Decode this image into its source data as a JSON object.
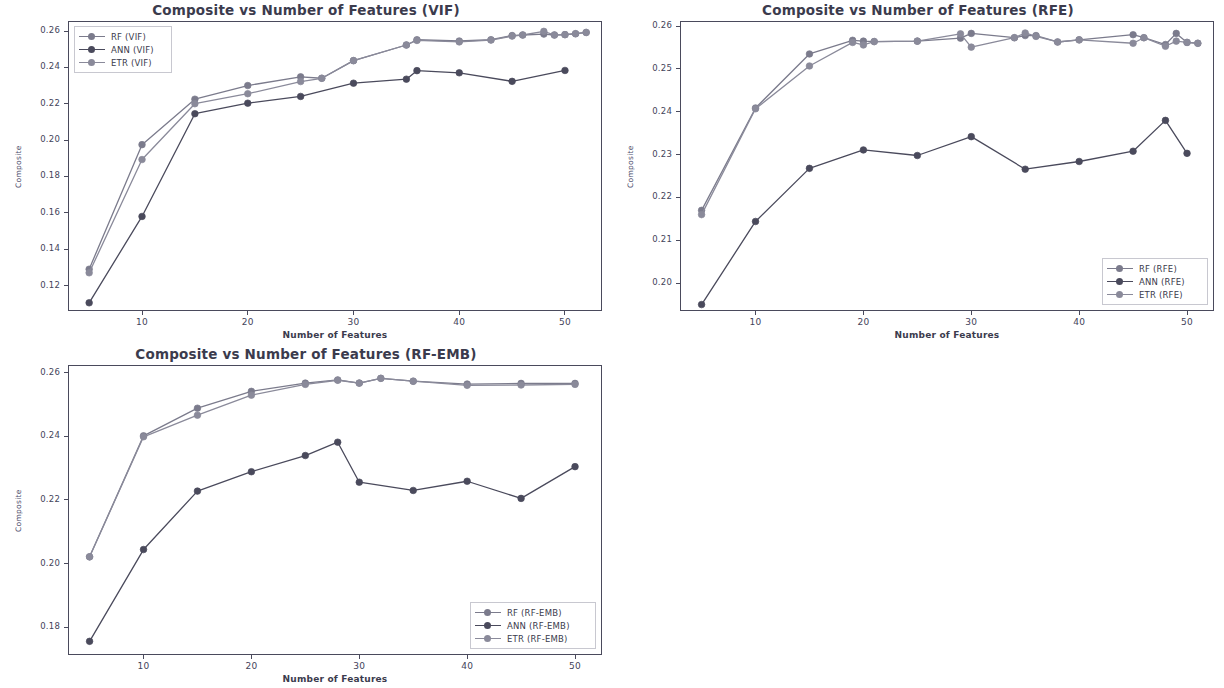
{
  "figure": {
    "width": 1224,
    "height": 688,
    "background": "#ffffff",
    "axis_color": "#4a4a5c",
    "text_color": "#3b3b4d"
  },
  "colors": {
    "rf": "#7b7b8c",
    "ann": "#4a4a5c",
    "etr": "#8a8a9a"
  },
  "chart_data": [
    {
      "id": "vif",
      "type": "line",
      "title": "Composite vs Number of Features (VIF)",
      "xlabel": "Number of Features",
      "ylabel": "Composite",
      "xlim": [
        3,
        53.5
      ],
      "ylim": [
        0.106,
        0.2655
      ],
      "xticks": [
        10,
        20,
        30,
        40,
        50
      ],
      "yticks": [
        0.12,
        0.14,
        0.16,
        0.18,
        0.2,
        0.22,
        0.24,
        0.26
      ],
      "ytick_labels": [
        "0.12",
        "0.14",
        "0.16",
        "0.18",
        "0.20",
        "0.22",
        "0.24",
        "0.26"
      ],
      "xtick_labels": [
        "10",
        "20",
        "30",
        "40",
        "50"
      ],
      "grid": false,
      "legend_position": "upper left",
      "series": [
        {
          "name": "RF (VIF)",
          "color_key": "rf",
          "x": [
            5,
            10,
            15,
            20,
            25,
            27,
            30,
            35,
            36,
            40,
            43,
            45,
            46,
            48,
            49,
            50,
            51,
            52
          ],
          "y": [
            0.129,
            0.1975,
            0.2225,
            0.23,
            0.2348,
            0.234,
            0.2437,
            0.2523,
            0.2552,
            0.2545,
            0.2552,
            0.2575,
            0.2578,
            0.2583,
            0.2578,
            0.258,
            0.2585,
            0.2592
          ]
        },
        {
          "name": "ANN (VIF)",
          "color_key": "ann",
          "x": [
            5,
            10,
            15,
            20,
            25,
            30,
            35,
            36,
            40,
            45,
            50
          ],
          "y": [
            0.1105,
            0.158,
            0.2145,
            0.2203,
            0.224,
            0.2313,
            0.2335,
            0.2382,
            0.237,
            0.2323,
            0.2383
          ]
        },
        {
          "name": "ETR (VIF)",
          "color_key": "etr",
          "x": [
            5,
            10,
            15,
            20,
            25,
            27,
            30,
            35,
            36,
            40,
            43,
            45,
            46,
            48,
            49,
            50,
            51,
            52
          ],
          "y": [
            0.127,
            0.1893,
            0.22,
            0.2255,
            0.2322,
            0.234,
            0.2437,
            0.2523,
            0.2548,
            0.254,
            0.255,
            0.2572,
            0.2578,
            0.2598,
            0.2578,
            0.258,
            0.2585,
            0.2592
          ]
        }
      ]
    },
    {
      "id": "rfe",
      "type": "line",
      "title": "Composite vs Number of Features (RFE)",
      "xlabel": "Number of Features",
      "ylabel": "Composite",
      "xlim": [
        3,
        52.5
      ],
      "ylim": [
        0.1935,
        0.2612
      ],
      "xticks": [
        10,
        20,
        30,
        40,
        50
      ],
      "yticks": [
        0.2,
        0.21,
        0.22,
        0.23,
        0.24,
        0.25,
        0.26
      ],
      "ytick_labels": [
        "0.20",
        "0.21",
        "0.22",
        "0.23",
        "0.24",
        "0.25",
        "0.26"
      ],
      "xtick_labels": [
        "10",
        "20",
        "30",
        "40",
        "50"
      ],
      "grid": false,
      "legend_position": "lower right",
      "series": [
        {
          "name": "RF (RFE)",
          "color_key": "rf",
          "x": [
            5,
            10,
            15,
            19,
            20,
            21,
            25,
            29,
            30,
            34,
            35,
            36,
            38,
            40,
            45,
            46,
            48,
            49,
            50,
            51
          ],
          "y": [
            0.217,
            0.2409,
            0.2535,
            0.2567,
            0.2565,
            0.2564,
            0.2565,
            0.2572,
            0.2583,
            0.2573,
            0.2578,
            0.2578,
            0.2563,
            0.2568,
            0.258,
            0.2573,
            0.2557,
            0.2583,
            0.2562,
            0.256
          ]
        },
        {
          "name": "ANN (RFE)",
          "color_key": "ann",
          "x": [
            5,
            10,
            15,
            20,
            25,
            30,
            35,
            40,
            45,
            48,
            50
          ],
          "y": [
            0.195,
            0.2144,
            0.2268,
            0.2311,
            0.2298,
            0.2342,
            0.2266,
            0.2284,
            0.2308,
            0.238,
            0.2303
          ]
        },
        {
          "name": "ETR (RFE)",
          "color_key": "etr",
          "x": [
            5,
            10,
            15,
            19,
            20,
            21,
            25,
            29,
            30,
            34,
            35,
            36,
            38,
            40,
            45,
            46,
            48,
            49,
            50,
            51
          ],
          "y": [
            0.216,
            0.2407,
            0.2507,
            0.2562,
            0.2556,
            0.2564,
            0.2565,
            0.2582,
            0.2551,
            0.2573,
            0.2584,
            0.2576,
            0.2563,
            0.2568,
            0.256,
            0.2573,
            0.2553,
            0.2565,
            0.2562,
            0.256
          ]
        }
      ]
    },
    {
      "id": "rfemb",
      "type": "line",
      "title": "Composite vs Number of Features (RF-EMB)",
      "xlabel": "Number of Features",
      "ylabel": "Composite",
      "xlim": [
        3,
        52.5
      ],
      "ylim": [
        0.1712,
        0.2625
      ],
      "xticks": [
        10,
        20,
        30,
        40,
        50
      ],
      "yticks": [
        0.18,
        0.2,
        0.22,
        0.24,
        0.26
      ],
      "ytick_labels": [
        "0.18",
        "0.20",
        "0.22",
        "0.24",
        "0.26"
      ],
      "xtick_labels": [
        "10",
        "20",
        "30",
        "40",
        "50"
      ],
      "grid": false,
      "legend_position": "lower right",
      "series": [
        {
          "name": "RF (RF-EMB)",
          "color_key": "rf",
          "x": [
            5,
            10,
            15,
            20,
            25,
            28,
            30,
            32,
            35,
            40,
            45,
            50
          ],
          "y": [
            0.2021,
            0.2402,
            0.2489,
            0.2542,
            0.2568,
            0.2578,
            0.2568,
            0.2583,
            0.2574,
            0.2565,
            0.2567,
            0.2567
          ]
        },
        {
          "name": "ANN (RF-EMB)",
          "color_key": "ann",
          "x": [
            5,
            10,
            15,
            20,
            25,
            28,
            30,
            35,
            40,
            45,
            50
          ],
          "y": [
            0.1755,
            0.2044,
            0.2228,
            0.2289,
            0.234,
            0.2382,
            0.2256,
            0.223,
            0.2259,
            0.2205,
            0.2305
          ]
        },
        {
          "name": "ETR (RF-EMB)",
          "color_key": "etr",
          "x": [
            5,
            10,
            15,
            20,
            25,
            28,
            30,
            32,
            35,
            40,
            45,
            50
          ],
          "y": [
            0.2021,
            0.2399,
            0.2467,
            0.253,
            0.2564,
            0.2577,
            0.2568,
            0.2583,
            0.2574,
            0.2561,
            0.2562,
            0.2564
          ]
        }
      ]
    }
  ],
  "panels": [
    {
      "id": "vif",
      "left": 0,
      "top": 0,
      "width": 612,
      "height": 344,
      "plot": {
        "left": 68,
        "top": 21,
        "width": 534,
        "height": 290
      }
    },
    {
      "id": "rfe",
      "left": 612,
      "top": 0,
      "width": 612,
      "height": 344,
      "plot": {
        "left": 68,
        "top": 21,
        "width": 534,
        "height": 290
      }
    },
    {
      "id": "rfemb",
      "left": 0,
      "top": 344,
      "width": 612,
      "height": 344,
      "plot": {
        "left": 68,
        "top": 21,
        "width": 534,
        "height": 290
      }
    }
  ]
}
